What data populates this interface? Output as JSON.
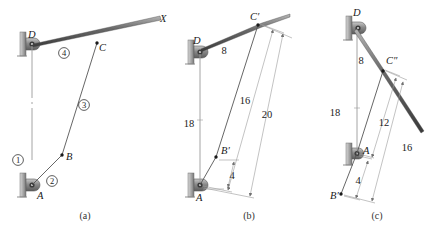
{
  "figure": {
    "type": "engineering-diagram",
    "captions": [
      {
        "id": "cap-a",
        "text": "(a)",
        "x": 85,
        "y": 219
      },
      {
        "id": "cap-b",
        "text": "(b)",
        "x": 249,
        "y": 219
      },
      {
        "id": "cap-c",
        "text": "(c)",
        "x": 377,
        "y": 219
      }
    ]
  },
  "panel_a": {
    "caption": "(a)",
    "point_labels": [
      {
        "name": "D",
        "text": "D",
        "x": 28,
        "y": 38
      },
      {
        "name": "C",
        "text": "C",
        "x": 99,
        "y": 51
      },
      {
        "name": "X",
        "text": "X",
        "x": 160,
        "y": 22
      },
      {
        "name": "B",
        "text": "B",
        "x": 66,
        "y": 160
      },
      {
        "name": "A",
        "text": "A",
        "x": 37,
        "y": 199
      }
    ],
    "link_numbers": [
      {
        "name": "link-1",
        "text": "1",
        "x": 18,
        "y": 163
      },
      {
        "name": "link-2",
        "text": "2",
        "x": 52,
        "y": 184
      },
      {
        "name": "link-3",
        "text": "3",
        "x": 84,
        "y": 108
      },
      {
        "name": "link-4",
        "text": "4",
        "x": 64,
        "y": 56
      }
    ]
  },
  "panel_b": {
    "caption": "(b)",
    "point_labels": [
      {
        "name": "D",
        "text": "D",
        "x": 196,
        "y": 44
      },
      {
        "name": "C-prime",
        "text": "C′",
        "x": 255,
        "y": 21
      },
      {
        "name": "B-prime",
        "text": "B′",
        "x": 224,
        "y": 154
      },
      {
        "name": "A",
        "text": "A",
        "x": 192,
        "y": 199
      }
    ],
    "dimensions": [
      {
        "name": "dim-DC",
        "value": "8",
        "x": 224,
        "y": 51
      },
      {
        "name": "dim-DA",
        "value": "18",
        "x": 186,
        "y": 124
      },
      {
        "name": "dim-AC",
        "value": "16",
        "x": 245,
        "y": 100
      },
      {
        "name": "dim-AC-outer",
        "value": "20",
        "x": 267,
        "y": 114
      },
      {
        "name": "dim-AB",
        "value": "4",
        "x": 232,
        "y": 176
      }
    ]
  },
  "panel_c": {
    "caption": "(c)",
    "point_labels": [
      {
        "name": "D",
        "text": "D",
        "x": 353,
        "y": 16
      },
      {
        "name": "C-double-prime",
        "text": "C″",
        "x": 388,
        "y": 64
      },
      {
        "name": "A",
        "text": "A",
        "x": 363,
        "y": 154
      },
      {
        "name": "B-prime",
        "text": "B′",
        "x": 334,
        "y": 199
      }
    ],
    "dimensions": [
      {
        "name": "dim-DC",
        "value": "8",
        "x": 361,
        "y": 61
      },
      {
        "name": "dim-DA",
        "value": "18",
        "x": 332,
        "y": 112
      },
      {
        "name": "dim-AC",
        "value": "12",
        "x": 384,
        "y": 122
      },
      {
        "name": "dim-BC",
        "value": "16",
        "x": 406,
        "y": 147
      },
      {
        "name": "dim-AB",
        "value": "4",
        "x": 358,
        "y": 180
      }
    ]
  },
  "colors": {
    "background": "#ffffff",
    "link_stroke": "#555555",
    "ground_stroke": "#9a9a9a",
    "dimension_stroke": "#9a9a9a",
    "text": "#1a1a1a",
    "pivot_body": "#8d8d8d",
    "wall_hatch": "#aaaaaa"
  }
}
